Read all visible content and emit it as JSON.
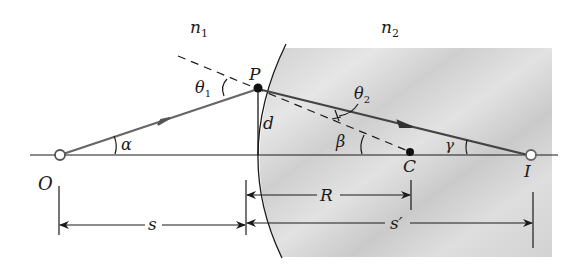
{
  "diagram": {
    "type": "optics-refraction-spherical-surface",
    "media": {
      "left": {
        "symbol": "n",
        "subscript": "1"
      },
      "right": {
        "symbol": "n",
        "subscript": "2"
      }
    },
    "points": {
      "object": "O",
      "refraction_point": "P",
      "center_of_curvature": "C",
      "image": "I"
    },
    "angles": {
      "incidence": {
        "symbol": "θ",
        "subscript": "1"
      },
      "refraction": {
        "symbol": "θ",
        "subscript": "2"
      },
      "alpha": "α",
      "beta": "β",
      "gamma": "γ"
    },
    "lengths": {
      "height": "d",
      "object_distance": "s",
      "radius": "R",
      "image_distance": "s′"
    },
    "colors": {
      "ray": "#555555",
      "line": "#1a1a1a",
      "shade": "#d4d4d4"
    }
  }
}
